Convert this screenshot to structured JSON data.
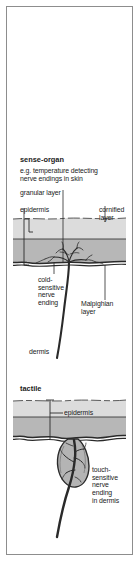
{
  "figure": {
    "title_block": {
      "heading": "sense-organ",
      "description": "e.g. temperature detecting\nnerve endings in skin"
    },
    "diagram_top": {
      "name": "temperature-detecting-nerve-endings-in-skin",
      "labels": {
        "granular_layer": "granular layer",
        "epidermis": "epidermis",
        "cornified_layer": "cornified\nlayer",
        "cold_sensitive_nerve_ending": "cold-\nsensitive\nnerve\nending",
        "malpighian_layer": "Malpighian\nlayer",
        "dermis": "dermis"
      }
    },
    "diagram_bottom": {
      "name": "tactile-touch-sensitive-nerve-ending",
      "labels": {
        "tactile": "tactile",
        "epidermis": "epidermis",
        "touch_sensitive_nerve_ending": "touch-\nsensitive\nnerve\nending\nin dermis"
      }
    },
    "colors": {
      "page_background": "#ffffff",
      "frame_border": "#8d8d8d",
      "cornified_layer_fill": "#dcdcdc",
      "granular_layer_fill": "#b7b7b7",
      "dermis_fill": "#ffffff",
      "corpuscle_fill": "#b4b4b4",
      "ink": "#2a2a2a",
      "text": "#1b1b1b"
    }
  }
}
